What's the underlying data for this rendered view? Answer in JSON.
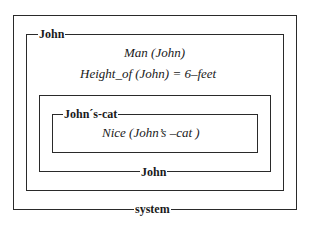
{
  "diagram": {
    "type": "nested-context-boxes",
    "boxes": [
      {
        "id": "system",
        "label": "system",
        "label_position": "bottom-center"
      },
      {
        "id": "john-outer",
        "label": "John",
        "label_position": "top-left",
        "statements": [
          "Man (John)",
          "Height_of (John) = 6–feet"
        ]
      },
      {
        "id": "john-inner",
        "label": "John",
        "label_position": "bottom-center"
      },
      {
        "id": "johns-cat",
        "label": "John´s-cat",
        "label_position": "top-left",
        "statements": [
          "Nice (John’s –cat )"
        ]
      }
    ]
  }
}
